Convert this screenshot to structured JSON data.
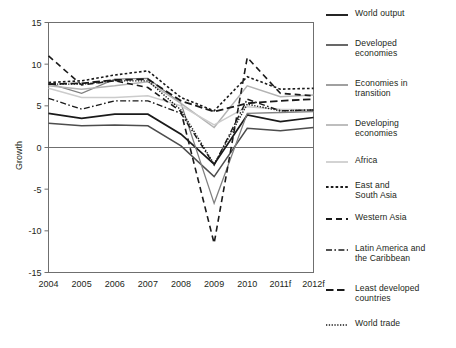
{
  "chart_data": {
    "type": "line",
    "title": "",
    "xlabel": "",
    "ylabel": "Growth",
    "categories": [
      "2004",
      "2005",
      "2006",
      "2007",
      "2008",
      "2009",
      "2010",
      "2011f",
      "2012f"
    ],
    "ylim": [
      -15,
      15
    ],
    "yticks": [
      15,
      10,
      5,
      0,
      -5,
      -10,
      -15
    ],
    "yticklabels": [
      "15",
      "10",
      "5",
      "0",
      "-5",
      "-10",
      "-15"
    ],
    "grid": false,
    "zero_line": true,
    "legend_position": "right",
    "series": [
      {
        "name": "World output",
        "style": "solid",
        "color": "#1a1a1a",
        "width": 1.7,
        "values": [
          4.1,
          3.5,
          4.0,
          4.0,
          1.6,
          -2.0,
          3.9,
          3.1,
          3.6
        ]
      },
      {
        "name": "Developed economies",
        "style": "solid",
        "color": "#4d4d4d",
        "width": 1.5,
        "values": [
          2.9,
          2.6,
          2.7,
          2.6,
          0.2,
          -3.5,
          2.3,
          2.0,
          2.4
        ]
      },
      {
        "name": "Economies in transition",
        "style": "solid",
        "color": "#808080",
        "width": 1.3,
        "values": [
          7.7,
          6.5,
          8.2,
          8.3,
          5.3,
          -6.7,
          4.1,
          4.2,
          4.3
        ]
      },
      {
        "name": "Developing economies",
        "style": "solid",
        "color": "#b3b3b3",
        "width": 1.5,
        "values": [
          7.4,
          7.0,
          7.4,
          7.9,
          5.3,
          2.4,
          7.4,
          6.1,
          6.3
        ]
      },
      {
        "name": "Africa",
        "style": "solid",
        "color": "#cccccc",
        "width": 1.5,
        "values": [
          7.1,
          6.0,
          6.0,
          6.2,
          5.0,
          2.7,
          4.9,
          4.6,
          4.5
        ]
      },
      {
        "name": "East and South Asia",
        "style": "dotted",
        "color": "#1a1a1a",
        "width": 1.6,
        "values": [
          7.8,
          8.0,
          8.7,
          9.2,
          6.0,
          4.4,
          8.5,
          7.0,
          7.1
        ]
      },
      {
        "name": "Western Asia",
        "style": "dashed",
        "color": "#1a1a1a",
        "width": 1.6,
        "values": [
          11.0,
          7.5,
          8.0,
          7.2,
          4.3,
          -11.5,
          10.8,
          6.5,
          6.2
        ]
      },
      {
        "name": "Latin America and the Caribbean",
        "style": "dashdot",
        "color": "#1a1a1a",
        "width": 1.4,
        "values": [
          5.9,
          4.6,
          5.6,
          5.6,
          4.1,
          -2.1,
          5.8,
          4.4,
          4.5
        ]
      },
      {
        "name": "Least developed countries",
        "style": "longdash",
        "color": "#1a1a1a",
        "width": 1.8,
        "values": [
          7.6,
          7.7,
          8.1,
          8.2,
          5.6,
          4.3,
          5.3,
          5.6,
          5.8
        ]
      },
      {
        "name": "World trade",
        "style": "finedotted",
        "color": "#1a1a1a",
        "width": 1.4,
        "values": [
          7.6,
          7.6,
          8.0,
          8.0,
          4.5,
          -2.0,
          5.2,
          4.4,
          4.5
        ]
      }
    ]
  },
  "axis": {
    "y_title": "Growth"
  },
  "legend": {
    "items": [
      {
        "label": "World output",
        "key": "legend-key-solid-black"
      },
      {
        "label": "Developed\neconomies",
        "key": "legend-key-solid-darkgray"
      },
      {
        "label": "Economies in\ntransition",
        "key": "legend-key-solid-gray"
      },
      {
        "label": "Developing\neconomies",
        "key": "legend-key-solid-lightgray"
      },
      {
        "label": "Africa",
        "key": "legend-key-solid-lightergray"
      },
      {
        "label": "East and\nSouth Asia",
        "key": "legend-key-dotted"
      },
      {
        "label": "Western Asia",
        "key": "legend-key-dashed"
      },
      {
        "label": "Latin America and\nthe Caribbean",
        "key": "legend-key-dashdot"
      },
      {
        "label": "Least developed\ncountries",
        "key": "legend-key-longdash"
      },
      {
        "label": "World trade",
        "key": "legend-key-finedotted"
      }
    ]
  }
}
